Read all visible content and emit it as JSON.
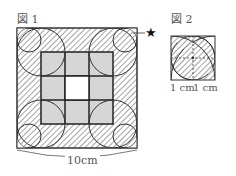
{
  "figure1": {
    "title": "図 1",
    "star_marker": "★",
    "dimension_label": "10cm"
  },
  "figure2": {
    "title": "図 2",
    "dim_left": "1 cm",
    "dim_right": "1 cm"
  },
  "colors": {
    "line": "#333333",
    "gray_fill": "#d4d4d4",
    "hatch": "#555555"
  }
}
